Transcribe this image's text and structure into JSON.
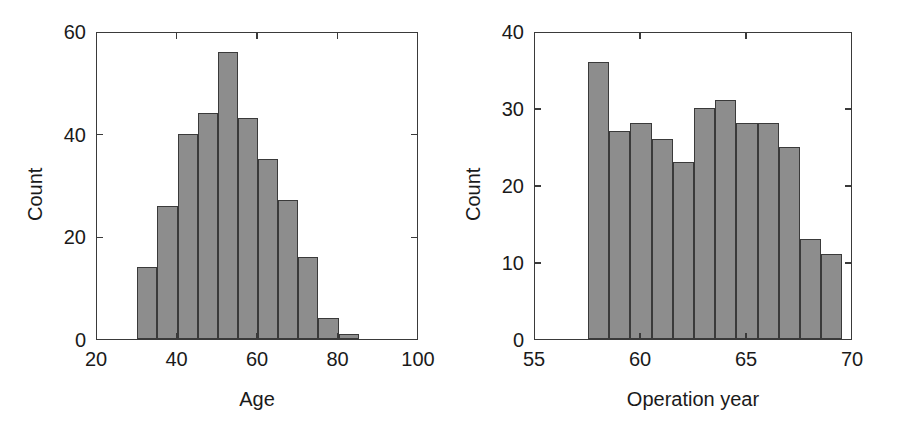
{
  "figure": {
    "background_color": "#ffffff",
    "bar_fill_color": "#8d8d8d",
    "bar_edge_color": "#3a3a3a",
    "axis_color": "#3a3a3a"
  },
  "chart_data": [
    {
      "type": "bar",
      "id": "age-histogram",
      "title": "",
      "xlabel": "Age",
      "ylabel": "Count",
      "xlim": [
        20,
        100
      ],
      "ylim": [
        0,
        60
      ],
      "xticks": [
        20,
        40,
        60,
        80,
        100
      ],
      "xtick_labels": [
        "20",
        "40",
        "60",
        "80",
        "100"
      ],
      "yticks": [
        0,
        20,
        40,
        60
      ],
      "ytick_labels": [
        "0",
        "20",
        "40",
        "60"
      ],
      "grid": false,
      "legend": null,
      "bin_edges": [
        30,
        35,
        40,
        45,
        50,
        55,
        60,
        65,
        70,
        75,
        80,
        85
      ],
      "bin_width": 5,
      "categories": [
        "30-35",
        "35-40",
        "40-45",
        "45-50",
        "50-55",
        "55-60",
        "60-65",
        "65-70",
        "70-75",
        "75-80",
        "80-85"
      ],
      "values": [
        14,
        26,
        40,
        44,
        56,
        43,
        35,
        27,
        16,
        4,
        1
      ]
    },
    {
      "type": "bar",
      "id": "operation-year-histogram",
      "title": "",
      "xlabel": "Operation year",
      "ylabel": "Count",
      "xlim": [
        55,
        70
      ],
      "ylim": [
        0,
        40
      ],
      "xticks": [
        55,
        60,
        65,
        70
      ],
      "xtick_labels": [
        "55",
        "60",
        "65",
        "70"
      ],
      "yticks": [
        0,
        10,
        20,
        30,
        40
      ],
      "ytick_labels": [
        "0",
        "10",
        "20",
        "30",
        "40"
      ],
      "grid": false,
      "legend": null,
      "bin_edges": [
        57.5,
        58.5,
        59.5,
        60.5,
        61.5,
        62.5,
        63.5,
        64.5,
        65.5,
        66.5,
        67.5,
        68.5,
        69.5
      ],
      "bin_width": 1,
      "categories": [
        "58",
        "59",
        "60",
        "61",
        "62",
        "63",
        "64",
        "65",
        "66",
        "67",
        "68",
        "69"
      ],
      "values": [
        36,
        27,
        28,
        26,
        23,
        30,
        31,
        28,
        28,
        25,
        13,
        11
      ]
    }
  ]
}
